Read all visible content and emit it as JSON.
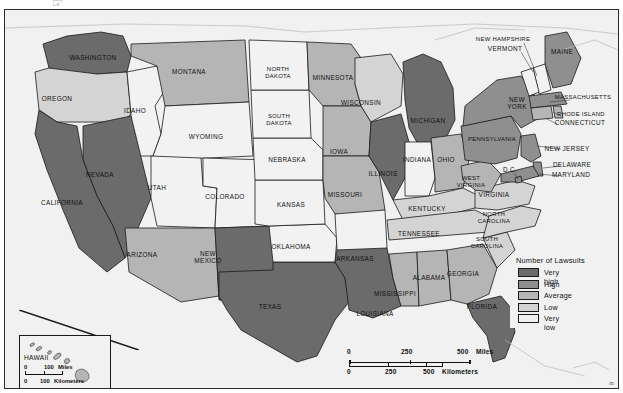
{
  "figure": {
    "top_glyph": "☞",
    "corner_mark": "m"
  },
  "legend": {
    "title": "Number of Lawsuits",
    "items": [
      {
        "label": "Very high",
        "color": "#6b6b6b"
      },
      {
        "label": "High",
        "color": "#8f8f8f"
      },
      {
        "label": "Average",
        "color": "#b5b5b5"
      },
      {
        "label": "Low",
        "color": "#d4d4d4"
      },
      {
        "label": "Very low",
        "color": "#f2f2f2"
      }
    ]
  },
  "scale_main": {
    "miles": {
      "ticks": [
        "0",
        "250",
        "500"
      ],
      "unit": "Miles"
    },
    "kilometers": {
      "ticks": [
        "0",
        "250",
        "500"
      ],
      "unit": "Kilometers"
    }
  },
  "hawaii_inset": {
    "title": "HAWAII",
    "miles": {
      "ticks": [
        "0",
        "100"
      ],
      "unit": "Miles"
    },
    "kilometers": {
      "ticks": [
        "0",
        "100"
      ],
      "unit": "Kilometers"
    }
  },
  "map": {
    "ocean_color": "#f0f1f0",
    "border_color": "#1a1a1a",
    "states": [
      {
        "name": "WASHINGTON",
        "label": "WASHINGTON",
        "class": "very_high",
        "lx": 88,
        "ly": 48
      },
      {
        "name": "OREGON",
        "label": "OREGON",
        "class": "low",
        "lx": 52,
        "ly": 89
      },
      {
        "name": "IDAHO",
        "label": "IDAHO",
        "class": "very_low",
        "lx": 130,
        "ly": 101
      },
      {
        "name": "MONTANA",
        "label": "MONTANA",
        "class": "average",
        "lx": 184,
        "ly": 62
      },
      {
        "name": "WYOMING",
        "label": "WYOMING",
        "class": "very_low",
        "lx": 201,
        "ly": 127
      },
      {
        "name": "NEVADA",
        "label": "NEVADA",
        "class": "very_high",
        "lx": 95,
        "ly": 165
      },
      {
        "name": "CALIFORNIA",
        "label": "CALIFORNIA",
        "class": "very_high",
        "lx": 57,
        "ly": 193
      },
      {
        "name": "UTAH",
        "label": "UTAH",
        "class": "very_low",
        "lx": 152,
        "ly": 178
      },
      {
        "name": "COLORADO",
        "label": "COLORADO",
        "class": "very_low",
        "lx": 220,
        "ly": 187
      },
      {
        "name": "ARIZONA",
        "label": "ARIZONA",
        "class": "average",
        "lx": 137,
        "ly": 245
      },
      {
        "name": "NEW MEXICO",
        "label": "NEW\nMEXICO",
        "class": "very_high",
        "lx": 203,
        "ly": 247
      },
      {
        "name": "TEXAS",
        "label": "TEXAS",
        "class": "very_high",
        "lx": 265,
        "ly": 297
      },
      {
        "name": "OKLAHOMA",
        "label": "OKLAHOMA",
        "class": "very_low",
        "lx": 286,
        "ly": 237
      },
      {
        "name": "KANSAS",
        "label": "KANSAS",
        "class": "very_low",
        "lx": 286,
        "ly": 195
      },
      {
        "name": "NEBRASKA",
        "label": "NEBRASKA",
        "class": "very_low",
        "lx": 282,
        "ly": 150
      },
      {
        "name": "SOUTH DAKOTA",
        "label": "SOUTH\nDAKOTA",
        "class": "very_low",
        "lx": 274,
        "ly": 110
      },
      {
        "name": "NORTH DAKOTA",
        "label": "NORTH\nDAKOTA",
        "class": "very_low",
        "lx": 273,
        "ly": 63
      },
      {
        "name": "MINNESOTA",
        "label": "MINNESOTA",
        "class": "average",
        "lx": 328,
        "ly": 68
      },
      {
        "name": "IOWA",
        "label": "IOWA",
        "class": "average",
        "lx": 334,
        "ly": 142
      },
      {
        "name": "MISSOURI",
        "label": "MISSOURI",
        "class": "average",
        "lx": 340,
        "ly": 185
      },
      {
        "name": "ARKANSAS",
        "label": "ARKANSAS",
        "class": "very_low",
        "lx": 350,
        "ly": 249
      },
      {
        "name": "LOUISIANA",
        "label": "LOUISIANA",
        "class": "very_high",
        "lx": 370,
        "ly": 304
      },
      {
        "name": "MISSISSIPPI",
        "label": "MISSISSIPPI",
        "class": "average",
        "lx": 390,
        "ly": 284
      },
      {
        "name": "WISCONSIN",
        "label": "WISCONSIN",
        "class": "low",
        "lx": 356,
        "ly": 93
      },
      {
        "name": "ILLINOIS",
        "label": "ILLINOIS",
        "class": "very_high",
        "lx": 378,
        "ly": 164
      },
      {
        "name": "MICHIGAN",
        "label": "MICHIGAN",
        "class": "very_high",
        "lx": 423,
        "ly": 111
      },
      {
        "name": "INDIANA",
        "label": "INDIANA",
        "class": "very_low",
        "lx": 412,
        "ly": 150
      },
      {
        "name": "OHIO",
        "label": "OHIO",
        "class": "average",
        "lx": 441,
        "ly": 150
      },
      {
        "name": "KENTUCKY",
        "label": "KENTUCKY",
        "class": "low",
        "lx": 422,
        "ly": 199
      },
      {
        "name": "TENNESSEE",
        "label": "TENNESSEE",
        "class": "low",
        "lx": 414,
        "ly": 224
      },
      {
        "name": "ALABAMA",
        "label": "ALABAMA",
        "class": "average",
        "lx": 424,
        "ly": 268
      },
      {
        "name": "GEORGIA",
        "label": "GEORGIA",
        "class": "average",
        "lx": 458,
        "ly": 264
      },
      {
        "name": "FLORIDA",
        "label": "FLORIDA",
        "class": "very_high",
        "lx": 477,
        "ly": 297
      },
      {
        "name": "SOUTH CAROLINA",
        "label": "SOUTH\nCAROLINA",
        "class": "low",
        "lx": 482,
        "ly": 233
      },
      {
        "name": "NORTH CAROLINA",
        "label": "NORTH\nCAROLINA",
        "class": "low",
        "lx": 489,
        "ly": 208
      },
      {
        "name": "VIRGINIA",
        "label": "VIRGINIA",
        "class": "low",
        "lx": 489,
        "ly": 185
      },
      {
        "name": "WEST VIRGINIA",
        "label": "WEST\nVIRGINIA",
        "class": "average",
        "lx": 466,
        "ly": 172
      },
      {
        "name": "PENNSYLVANIA",
        "label": "PENNSYLVANIA",
        "class": "high",
        "lx": 487,
        "ly": 130
      },
      {
        "name": "NEW YORK",
        "label": "NEW\nYORK",
        "class": "high",
        "lx": 512,
        "ly": 93
      },
      {
        "name": "MAINE",
        "label": "MAINE",
        "class": "high",
        "lx": 557,
        "ly": 42
      },
      {
        "name": "NEW HAMPSHIRE",
        "label": "NEW HAMPSHIRE",
        "class": "very_low",
        "lx": 498,
        "ly": 30
      },
      {
        "name": "VERMONT",
        "label": "VERMONT",
        "class": "very_low",
        "lx": 500,
        "ly": 39
      },
      {
        "name": "MASSACHUSETTS",
        "label": "MASSACHUSETTS",
        "class": "high",
        "lx": 578,
        "ly": 88
      },
      {
        "name": "RHODE ISLAND",
        "label": "RHODE ISLAND",
        "class": "average",
        "lx": 576,
        "ly": 105
      },
      {
        "name": "CONNECTICUT",
        "label": "CONNECTICUT",
        "class": "average",
        "lx": 575,
        "ly": 113
      },
      {
        "name": "NEW JERSEY",
        "label": "NEW JERSEY",
        "class": "high",
        "lx": 562,
        "ly": 139
      },
      {
        "name": "DELAWARE",
        "label": "DELAWARE",
        "class": "high",
        "lx": 567,
        "ly": 155
      },
      {
        "name": "MARYLAND",
        "label": "MARYLAND",
        "class": "high",
        "lx": 566,
        "ly": 165
      },
      {
        "name": "D.C.",
        "label": "D.C.",
        "class": "high",
        "lx": 505,
        "ly": 160
      }
    ]
  }
}
